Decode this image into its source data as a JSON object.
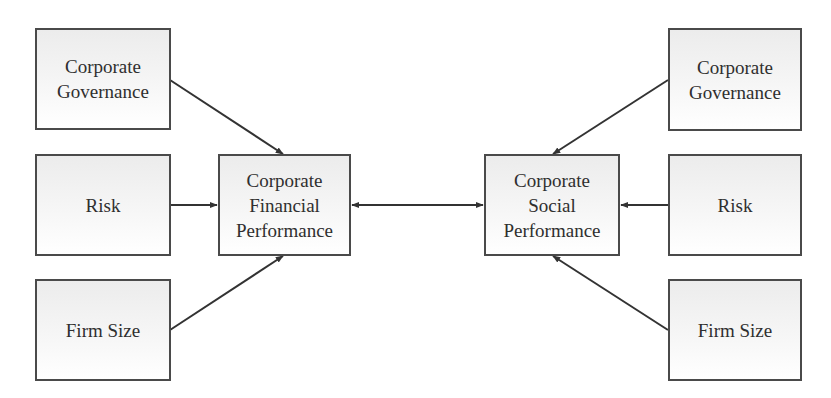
{
  "diagram": {
    "type": "conceptual-model",
    "colors": {
      "border": "#4a4a4a",
      "text": "#2f2f2f",
      "line": "#333333",
      "fill_top": "#ececec",
      "fill_bottom": "#ffffff"
    },
    "left": {
      "governance": {
        "label": "Corporate\nGovernance"
      },
      "risk": {
        "label": "Risk"
      },
      "size": {
        "label": "Firm Size"
      }
    },
    "center": {
      "cfp": {
        "label": "Corporate\nFinancial\nPerformance"
      },
      "csp": {
        "label": "Corporate\nSocial\nPerformance"
      }
    },
    "right": {
      "governance": {
        "label": "Corporate\nGovernance"
      },
      "risk": {
        "label": "Risk"
      },
      "size": {
        "label": "Firm Size"
      }
    },
    "edges": [
      {
        "from": "left.governance",
        "to": "center.cfp",
        "direction": "forward"
      },
      {
        "from": "left.risk",
        "to": "center.cfp",
        "direction": "forward"
      },
      {
        "from": "left.size",
        "to": "center.cfp",
        "direction": "forward"
      },
      {
        "from": "center.cfp",
        "to": "center.csp",
        "direction": "bidirectional"
      },
      {
        "from": "right.governance",
        "to": "center.csp",
        "direction": "forward"
      },
      {
        "from": "right.risk",
        "to": "center.csp",
        "direction": "forward"
      },
      {
        "from": "right.size",
        "to": "center.csp",
        "direction": "forward"
      }
    ]
  }
}
